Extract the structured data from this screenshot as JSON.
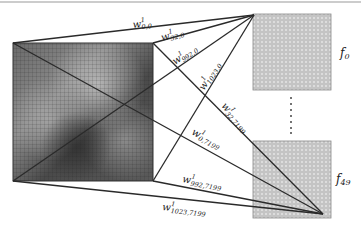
{
  "diagram": {
    "input_image": {
      "label": "input image with grid",
      "x": 13,
      "y": 43,
      "w": 140,
      "h": 138,
      "grid_step": 4
    },
    "feature_maps": [
      {
        "label": "f",
        "sub": "0",
        "x": 253,
        "y": 14,
        "w": 78,
        "h": 76,
        "anchor": [
          254,
          15
        ]
      },
      {
        "label": "f",
        "sub": "49",
        "x": 253,
        "y": 141,
        "w": 78,
        "h": 77,
        "anchor": [
          323,
          214
        ]
      }
    ],
    "ellipsis": "⋮",
    "weights": [
      {
        "base": "w",
        "sup": "1",
        "sub": "0,0",
        "from": [
          13,
          43
        ],
        "to": "f0"
      },
      {
        "base": "w",
        "sup": "1",
        "sub": "32,0",
        "from": [
          153,
          43
        ],
        "to": "f0"
      },
      {
        "base": "w",
        "sup": "1",
        "sub": "992,0",
        "from": [
          13,
          181
        ],
        "to": "f0"
      },
      {
        "base": "w",
        "sup": "1",
        "sub": "1023,0",
        "from": [
          153,
          181
        ],
        "to": "f0"
      },
      {
        "base": "w",
        "sup": "1",
        "sub": "32,7199",
        "from": [
          153,
          43
        ],
        "to": "f49"
      },
      {
        "base": "w",
        "sup": "1",
        "sub": "0,7199",
        "from": [
          13,
          43
        ],
        "to": "f49"
      },
      {
        "base": "w",
        "sup": "1",
        "sub": "992,7199",
        "from": [
          153,
          181
        ],
        "to": "f49"
      },
      {
        "base": "w",
        "sup": "1",
        "sub": "1023,7199",
        "from": [
          13,
          181
        ],
        "to": "f49"
      }
    ]
  }
}
